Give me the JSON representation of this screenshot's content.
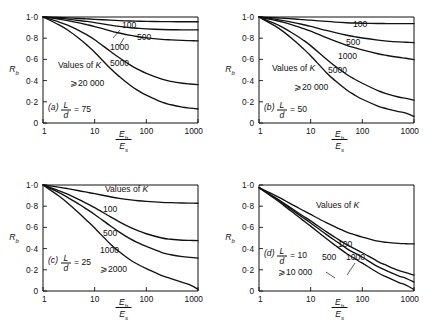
{
  "figure": {
    "ylabel": "R",
    "ylabel_sub": "b",
    "xlabel_num": "E",
    "xlabel_num_sub": "b",
    "xlabel_den": "E",
    "xlabel_den_sub": "s",
    "values_of_k": "Values of K",
    "y_ticks": [
      "1·0",
      "0·8",
      "0·6",
      "0·4",
      "0·2",
      "0"
    ],
    "y_tick_values": [
      1.0,
      0.8,
      0.6,
      0.4,
      0.2,
      0
    ],
    "x_ticks": [
      "1",
      "10",
      "100",
      "1000"
    ],
    "x_tick_values": [
      1,
      10,
      100,
      1000
    ]
  },
  "chart_data": [
    {
      "type": "line",
      "panel": "a",
      "panel_label": "(a)",
      "ratio_label": "L",
      "ratio_label_den": "d",
      "ratio_value": "= 75",
      "caption": "(a) L/d = 75",
      "title": "",
      "xlabel": "Eb/Es",
      "ylabel": "Rb",
      "xlim": [
        1,
        1000
      ],
      "ylim": [
        0,
        1.0
      ],
      "xscale": "log",
      "grid": false,
      "legend": "inline curve labels",
      "annotations": [
        "Values of K"
      ],
      "series": [
        {
          "name": "100",
          "label": "100",
          "asymptote": 0.955,
          "x": [
            1,
            2,
            3,
            5,
            7,
            10,
            20,
            30,
            50,
            70,
            100,
            200,
            300,
            500,
            700,
            1000
          ],
          "values": [
            1.0,
            0.995,
            0.991,
            0.986,
            0.982,
            0.978,
            0.97,
            0.966,
            0.962,
            0.96,
            0.959,
            0.957,
            0.956,
            0.955,
            0.955,
            0.955
          ]
        },
        {
          "name": "500",
          "label": "500",
          "asymptote": 0.878,
          "x": [
            1,
            2,
            3,
            5,
            7,
            10,
            20,
            30,
            50,
            70,
            100,
            200,
            300,
            500,
            700,
            1000
          ],
          "values": [
            1.0,
            0.988,
            0.98,
            0.967,
            0.958,
            0.947,
            0.924,
            0.912,
            0.899,
            0.893,
            0.888,
            0.882,
            0.88,
            0.879,
            0.878,
            0.878
          ]
        },
        {
          "name": "1000",
          "label": "1000",
          "asymptote": 0.775,
          "x": [
            1,
            2,
            3,
            5,
            7,
            10,
            20,
            30,
            50,
            70,
            100,
            200,
            300,
            500,
            700,
            1000
          ],
          "values": [
            1.0,
            0.98,
            0.966,
            0.944,
            0.928,
            0.91,
            0.87,
            0.849,
            0.826,
            0.814,
            0.803,
            0.789,
            0.784,
            0.779,
            0.777,
            0.775
          ]
        },
        {
          "name": "5000",
          "label": "5000",
          "asymptote": 0.362,
          "x": [
            1,
            2,
            3,
            5,
            7,
            10,
            20,
            30,
            50,
            70,
            100,
            200,
            300,
            500,
            700,
            1000
          ],
          "values": [
            1.0,
            0.955,
            0.923,
            0.872,
            0.833,
            0.786,
            0.677,
            0.615,
            0.544,
            0.505,
            0.468,
            0.414,
            0.393,
            0.375,
            0.368,
            0.362
          ]
        },
        {
          "name": "⩾20 000",
          "label": "⩾20 000",
          "asymptote": 0.132,
          "x": [
            1,
            2,
            3,
            5,
            7,
            10,
            20,
            30,
            50,
            70,
            100,
            200,
            300,
            500,
            700,
            1000
          ],
          "values": [
            1.0,
            0.928,
            0.877,
            0.797,
            0.737,
            0.668,
            0.516,
            0.438,
            0.351,
            0.305,
            0.262,
            0.196,
            0.172,
            0.15,
            0.141,
            0.132
          ]
        }
      ]
    },
    {
      "type": "line",
      "panel": "b",
      "panel_label": "(b)",
      "ratio_label": "L",
      "ratio_label_den": "d",
      "ratio_value": "= 50",
      "caption": "(b) L/d = 50",
      "title": "",
      "xlabel": "Eb/Es",
      "ylabel": "Rb",
      "xlim": [
        1,
        1000
      ],
      "ylim": [
        0,
        1.0
      ],
      "xscale": "log",
      "grid": false,
      "legend": "inline curve labels",
      "annotations": [
        "Values of K"
      ],
      "series": [
        {
          "name": "100",
          "label": "100",
          "asymptote": 0.938,
          "x": [
            1,
            2,
            3,
            5,
            7,
            10,
            20,
            30,
            50,
            70,
            100,
            200,
            300,
            500,
            700,
            1000
          ],
          "values": [
            1.0,
            0.993,
            0.988,
            0.981,
            0.975,
            0.97,
            0.958,
            0.952,
            0.946,
            0.943,
            0.941,
            0.939,
            0.938,
            0.938,
            0.938,
            0.938
          ]
        },
        {
          "name": "500",
          "label": "500",
          "asymptote": 0.758,
          "x": [
            1,
            2,
            3,
            5,
            7,
            10,
            20,
            30,
            50,
            70,
            100,
            200,
            300,
            500,
            700,
            1000
          ],
          "values": [
            1.0,
            0.98,
            0.966,
            0.945,
            0.929,
            0.912,
            0.873,
            0.852,
            0.828,
            0.815,
            0.802,
            0.782,
            0.773,
            0.765,
            0.762,
            0.758
          ]
        },
        {
          "name": "1000",
          "label": "1000",
          "asymptote": 0.598,
          "x": [
            1,
            2,
            3,
            5,
            7,
            10,
            20,
            30,
            50,
            70,
            100,
            200,
            300,
            500,
            700,
            1000
          ],
          "values": [
            1.0,
            0.97,
            0.95,
            0.917,
            0.893,
            0.867,
            0.806,
            0.772,
            0.733,
            0.711,
            0.689,
            0.653,
            0.637,
            0.62,
            0.611,
            0.598
          ]
        },
        {
          "name": "5000",
          "label": "5000",
          "asymptote": 0.215,
          "x": [
            1,
            2,
            3,
            5,
            7,
            10,
            20,
            30,
            50,
            70,
            100,
            200,
            300,
            500,
            700,
            1000
          ],
          "values": [
            1.0,
            0.94,
            0.898,
            0.833,
            0.786,
            0.73,
            0.604,
            0.535,
            0.457,
            0.415,
            0.375,
            0.305,
            0.275,
            0.245,
            0.232,
            0.215
          ]
        },
        {
          "name": "⩾20 000",
          "label": "⩾20 000",
          "asymptote": 0.062,
          "x": [
            1,
            2,
            3,
            5,
            7,
            10,
            20,
            30,
            50,
            70,
            100,
            200,
            300,
            500,
            700,
            1000
          ],
          "values": [
            1.0,
            0.918,
            0.86,
            0.772,
            0.707,
            0.634,
            0.477,
            0.398,
            0.311,
            0.266,
            0.224,
            0.16,
            0.134,
            0.108,
            0.094,
            0.062
          ]
        }
      ]
    },
    {
      "type": "line",
      "panel": "c",
      "panel_label": "(c)",
      "ratio_label": "L",
      "ratio_label_den": "d",
      "ratio_value": "= 25",
      "caption": "(c) L/d = 25",
      "title": "",
      "xlabel": "Eb/Es",
      "ylabel": "Rb",
      "xlim": [
        1,
        1000
      ],
      "ylim": [
        0,
        1.0
      ],
      "xscale": "log",
      "grid": false,
      "legend": "inline curve labels",
      "annotations": [
        "Values of K"
      ],
      "series": [
        {
          "name": "100",
          "label": "100",
          "asymptote": 0.828,
          "x": [
            1,
            2,
            3,
            5,
            7,
            10,
            20,
            30,
            50,
            70,
            100,
            200,
            300,
            500,
            700,
            1000
          ],
          "values": [
            1.0,
            0.98,
            0.966,
            0.946,
            0.932,
            0.918,
            0.889,
            0.874,
            0.859,
            0.851,
            0.845,
            0.836,
            0.833,
            0.83,
            0.829,
            0.828
          ]
        },
        {
          "name": "500",
          "label": "500",
          "asymptote": 0.475,
          "x": [
            1,
            2,
            3,
            5,
            7,
            10,
            20,
            30,
            50,
            70,
            100,
            200,
            300,
            500,
            700,
            1000
          ],
          "values": [
            1.0,
            0.948,
            0.913,
            0.862,
            0.826,
            0.786,
            0.701,
            0.653,
            0.598,
            0.568,
            0.54,
            0.5,
            0.488,
            0.479,
            0.477,
            0.475
          ]
        },
        {
          "name": "1000",
          "label": "1000",
          "asymptote": 0.31,
          "x": [
            1,
            2,
            3,
            5,
            7,
            10,
            20,
            30,
            50,
            70,
            100,
            200,
            300,
            500,
            700,
            1000
          ],
          "values": [
            1.0,
            0.93,
            0.884,
            0.818,
            0.772,
            0.722,
            0.615,
            0.556,
            0.489,
            0.454,
            0.42,
            0.363,
            0.342,
            0.324,
            0.317,
            0.31
          ]
        },
        {
          "name": "⩾2000",
          "label": "⩾2000",
          "asymptote": 0.016,
          "x": [
            1,
            2,
            3,
            5,
            7,
            10,
            20,
            30,
            50,
            70,
            100,
            200,
            300,
            500,
            700,
            1000
          ],
          "values": [
            1.0,
            0.898,
            0.83,
            0.733,
            0.666,
            0.594,
            0.444,
            0.37,
            0.29,
            0.249,
            0.211,
            0.146,
            0.117,
            0.081,
            0.058,
            0.016
          ]
        }
      ]
    },
    {
      "type": "line",
      "panel": "d",
      "panel_label": "(d)",
      "ratio_label": "L",
      "ratio_label_den": "d",
      "ratio_value": "= 10",
      "caption": "(d) L/d = 10",
      "title": "",
      "xlabel": "Eb/Es",
      "ylabel": "Rb",
      "xlim": [
        1,
        1000
      ],
      "ylim": [
        0,
        1.0
      ],
      "xscale": "log",
      "grid": false,
      "legend": "inline curve labels",
      "annotations": [
        "Values of K"
      ],
      "series": [
        {
          "name": "100",
          "label": "100",
          "asymptote": 0.444,
          "x": [
            1,
            2,
            3,
            5,
            7,
            10,
            20,
            30,
            50,
            70,
            100,
            200,
            300,
            500,
            700,
            1000
          ],
          "values": [
            0.975,
            0.905,
            0.86,
            0.8,
            0.762,
            0.722,
            0.645,
            0.604,
            0.556,
            0.532,
            0.508,
            0.47,
            0.458,
            0.449,
            0.446,
            0.444
          ]
        },
        {
          "name": "500",
          "label": "500",
          "asymptote": 0.15,
          "x": [
            1,
            2,
            3,
            5,
            7,
            10,
            20,
            30,
            50,
            70,
            100,
            200,
            300,
            500,
            700,
            1000
          ],
          "values": [
            0.975,
            0.886,
            0.83,
            0.757,
            0.71,
            0.662,
            0.56,
            0.505,
            0.437,
            0.4,
            0.361,
            0.278,
            0.24,
            0.195,
            0.174,
            0.15
          ]
        },
        {
          "name": "1000",
          "label": "1000",
          "asymptote": 0.085,
          "x": [
            1,
            2,
            3,
            5,
            7,
            10,
            20,
            30,
            50,
            70,
            100,
            200,
            300,
            500,
            700,
            1000
          ],
          "values": [
            0.975,
            0.88,
            0.821,
            0.744,
            0.694,
            0.642,
            0.534,
            0.474,
            0.4,
            0.36,
            0.318,
            0.23,
            0.19,
            0.143,
            0.12,
            0.085
          ]
        },
        {
          "name": "⩾10 000",
          "label": "⩾10 000",
          "asymptote": 0.014,
          "x": [
            1,
            2,
            3,
            5,
            7,
            10,
            20,
            30,
            50,
            70,
            100,
            200,
            300,
            500,
            700,
            1000
          ],
          "values": [
            0.975,
            0.872,
            0.808,
            0.724,
            0.669,
            0.612,
            0.495,
            0.43,
            0.351,
            0.308,
            0.263,
            0.172,
            0.13,
            0.082,
            0.056,
            0.014
          ]
        }
      ]
    }
  ]
}
